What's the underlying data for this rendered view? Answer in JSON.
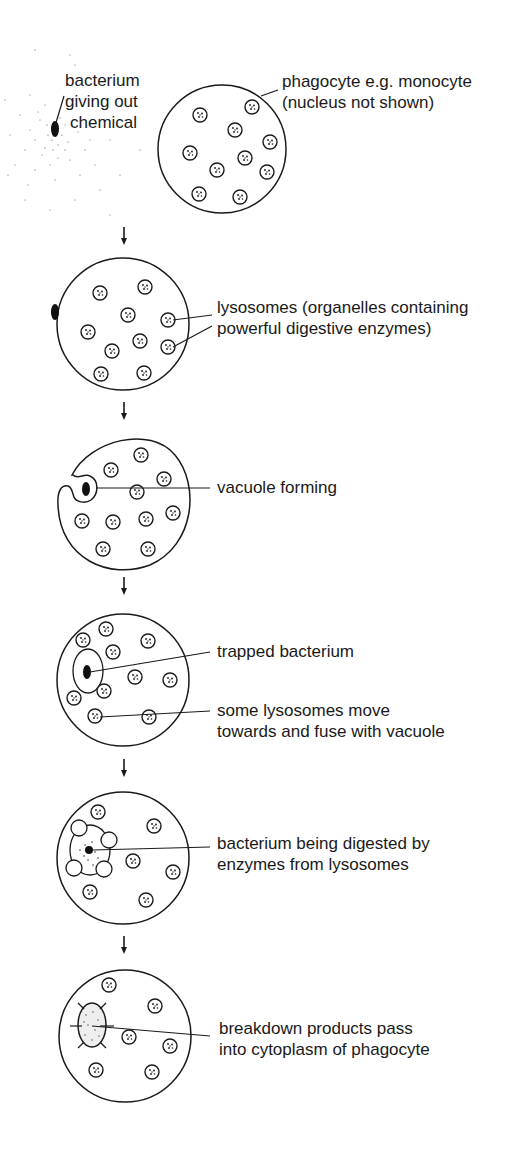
{
  "diagram": {
    "stages": [
      {
        "id": 1,
        "labels": {
          "bacterium": [
            "bacterium",
            "giving out",
            "chemical"
          ],
          "phagocyte": [
            "phagocyte e.g. monocyte",
            "(nucleus not shown)"
          ]
        }
      },
      {
        "id": 2,
        "labels": {
          "lysosomes": [
            "lysosomes (organelles containing",
            "powerful digestive enzymes)"
          ]
        }
      },
      {
        "id": 3,
        "labels": {
          "vacuole": [
            "vacuole forming"
          ]
        }
      },
      {
        "id": 4,
        "labels": {
          "trapped": [
            "trapped bacterium"
          ],
          "fuse": [
            "some lysosomes move",
            "towards and fuse with vacuole"
          ]
        }
      },
      {
        "id": 5,
        "labels": {
          "digested": [
            "bacterium being digested by",
            "enzymes from lysosomes"
          ]
        }
      },
      {
        "id": 6,
        "labels": {
          "breakdown": [
            "breakdown products pass",
            "into cytoplasm of phagocyte"
          ]
        }
      }
    ],
    "colors": {
      "ink": "#1a1a1a",
      "background": "#ffffff"
    }
  }
}
